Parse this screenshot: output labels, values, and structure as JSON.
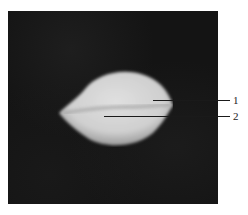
{
  "figure": {
    "background_color": "#141414",
    "object_color": "#d8d8d8",
    "callouts": [
      {
        "number": "1"
      },
      {
        "number": "2"
      }
    ]
  }
}
